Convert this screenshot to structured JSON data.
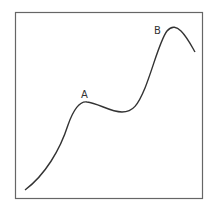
{
  "diagram": {
    "frame": {
      "stroke": "#555555"
    },
    "curve": {
      "stroke": "#333333"
    },
    "labels": {
      "a": "A",
      "b": "B"
    }
  }
}
